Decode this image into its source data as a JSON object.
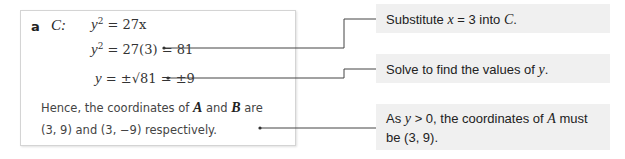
{
  "part": {
    "label": "a",
    "curve": "C:",
    "steps": [
      {
        "lhs": "y",
        "sup": "2",
        "rest": " = 27x"
      },
      {
        "lhs": "y",
        "sup": "2",
        "rest": " = 27(3) = 81"
      },
      {
        "lhs": "y",
        "rest": " = ±√81 = ±9"
      }
    ],
    "conclusion": {
      "line1_pre": "Hence, the coordinates of ",
      "pointA": "A",
      "and": " and ",
      "pointB": "B",
      "line1_post": " are",
      "line2": "(3, 9) and (3, −9) respectively."
    }
  },
  "callouts": [
    {
      "pre": "Substitute ",
      "var": "x",
      "mid": " = 3 into ",
      "var2": "C",
      "post": "."
    },
    {
      "pre": "Solve to find the values of ",
      "var": "y",
      "post": "."
    },
    {
      "pre": "As ",
      "var": "y",
      "mid": " > 0, the coordinates of ",
      "var2": "A",
      "post": " must",
      "line2": "be (3, 9)."
    }
  ],
  "colors": {
    "callout_bg": "#f0f0f0",
    "connector": "#444444",
    "box_border": "#d4d4d4"
  }
}
